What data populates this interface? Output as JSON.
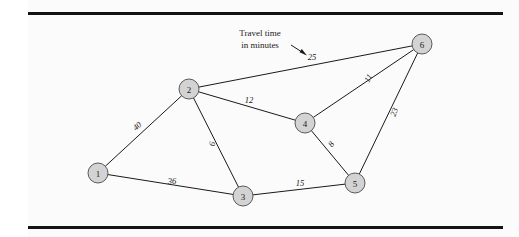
{
  "figure": {
    "background_color": "#fbfbfb",
    "page_color": "#ffffff",
    "rule_color": "#131313",
    "node_fill": "#d3d3d3",
    "node_stroke": "#4a4a4a",
    "edge_color": "#1a1a1a",
    "annotation": {
      "line1": "Travel time",
      "line2": "in minutes",
      "points_to_label": "25"
    },
    "nodes": [
      {
        "id": "1",
        "label": "1",
        "x": 98,
        "y": 173,
        "r": 10
      },
      {
        "id": "2",
        "label": "2",
        "x": 189,
        "y": 89,
        "r": 10
      },
      {
        "id": "3",
        "label": "3",
        "x": 243,
        "y": 196,
        "r": 10
      },
      {
        "id": "4",
        "label": "4",
        "x": 305,
        "y": 123,
        "r": 10
      },
      {
        "id": "5",
        "label": "5",
        "x": 355,
        "y": 183,
        "r": 10
      },
      {
        "id": "6",
        "label": "6",
        "x": 422,
        "y": 44,
        "r": 10
      }
    ],
    "edges": [
      {
        "from": "1",
        "to": "2",
        "label": "40",
        "lx": 137,
        "ly": 126,
        "rot": -43
      },
      {
        "from": "1",
        "to": "3",
        "label": "36",
        "lx": 172,
        "ly": 181,
        "rot": 0
      },
      {
        "from": "2",
        "to": "3",
        "label": "6",
        "lx": 212,
        "ly": 144,
        "rot": -80
      },
      {
        "from": "2",
        "to": "4",
        "label": "12",
        "lx": 249,
        "ly": 100,
        "rot": 0
      },
      {
        "from": "2",
        "to": "6",
        "label": "25",
        "lx": 312,
        "ly": 57,
        "rot": 0
      },
      {
        "from": "3",
        "to": "5",
        "label": "15",
        "lx": 300,
        "ly": 183,
        "rot": 0
      },
      {
        "from": "4",
        "to": "5",
        "label": "8",
        "lx": 331,
        "ly": 144,
        "rot": -52
      },
      {
        "from": "4",
        "to": "6",
        "label": "11",
        "lx": 368,
        "ly": 78,
        "rot": -60
      },
      {
        "from": "5",
        "to": "6",
        "label": "23",
        "lx": 394,
        "ly": 112,
        "rot": -70
      }
    ]
  }
}
